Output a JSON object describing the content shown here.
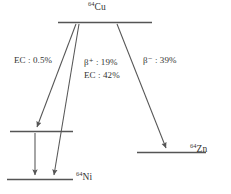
{
  "figure": {
    "type": "nuclear-decay-scheme",
    "parent": "Cu-64",
    "line_color": "#555555",
    "text_color": "#333333",
    "background": "#ffffff"
  },
  "levels": {
    "parent": {
      "label_mass": "64",
      "label_symbol": "Cu"
    },
    "intermediate": {
      "label_mass": "",
      "label_symbol": ""
    },
    "daughter_left": {
      "label_mass": "64",
      "label_symbol": "Ni"
    },
    "daughter_right": {
      "label_mass": "64",
      "label_symbol": "Zn"
    }
  },
  "branches": [
    {
      "id": "ec-excited",
      "mode": "EC",
      "sep": " : ",
      "value": "0.5%",
      "text": "EC : 0.5%"
    },
    {
      "id": "beta-plus",
      "mode": "β",
      "charge": "+",
      "sep": " : ",
      "value": "19%",
      "text": "β⁺ : 19%"
    },
    {
      "id": "ec-ground",
      "mode": "EC",
      "sep": " : ",
      "value": "42%",
      "text": "EC : 42%"
    },
    {
      "id": "beta-minus",
      "mode": "β",
      "charge": "−",
      "sep": " : ",
      "value": "39%",
      "text": "β⁻ : 39%"
    }
  ]
}
